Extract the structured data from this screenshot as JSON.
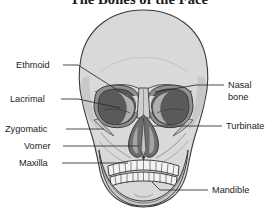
{
  "figure": {
    "title": "The Bones of the Face",
    "background_color": "#ffffff",
    "text_color": "#1c1c1c",
    "leader_line_color": "#2b2b2b",
    "bone_fill_color": "#d9d9d9",
    "bone_shade_color": "#bcbcbc",
    "cavity_dark_color": "#555555",
    "orbit_rim_color": "#8c8c8c",
    "outline_color": "#3a3a3a",
    "tooth_color": "#f2f2f2"
  },
  "labels": {
    "ethmoid": "Ethmoid",
    "lacrimal": "Lacrimal",
    "zygomatic": "Zygomatic",
    "vomer": "Vomer",
    "maxilla": "Maxilla",
    "nasal_bone_line1": "Nasal",
    "nasal_bone_line2": "bone",
    "turbinate": "Turbinate",
    "mandible": "Mandible"
  },
  "anatomy_parts": [
    {
      "name": "Ethmoid",
      "side": "left",
      "label_x": 20,
      "label_y": 65,
      "target_x": 133,
      "target_y": 100
    },
    {
      "name": "Lacrimal",
      "side": "left",
      "label_x": 14,
      "label_y": 99,
      "target_x": 120,
      "target_y": 108
    },
    {
      "name": "Zygomatic",
      "side": "left",
      "label_x": 8,
      "label_y": 129,
      "target_x": 104,
      "target_y": 129
    },
    {
      "name": "Vomer",
      "side": "left",
      "label_x": 27,
      "label_y": 146,
      "target_x": 139,
      "target_y": 147
    },
    {
      "name": "Maxilla",
      "side": "left",
      "label_x": 22,
      "label_y": 163,
      "target_x": 128,
      "target_y": 163
    },
    {
      "name": "Nasal bone",
      "side": "right",
      "label_x": 228,
      "label_y": 85,
      "target_x": 155,
      "target_y": 92
    },
    {
      "name": "Turbinate",
      "side": "right",
      "label_x": 226,
      "label_y": 126,
      "target_x": 152,
      "target_y": 126
    },
    {
      "name": "Mandible",
      "side": "right",
      "label_x": 212,
      "label_y": 190,
      "target_x": 158,
      "target_y": 180
    }
  ]
}
